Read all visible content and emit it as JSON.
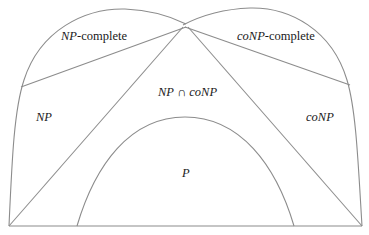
{
  "diagram": {
    "stroke_color": "#8c8c8c",
    "text_color": "#1a1a1a",
    "regions": {
      "np_complete": {
        "italic": "NP",
        "rest": "-complete"
      },
      "conp_complete": {
        "italic": "coNP",
        "rest": "-complete"
      },
      "np": {
        "italic": "NP"
      },
      "conp": {
        "italic": "coNP"
      },
      "intersection": {
        "left": "NP",
        "op": " ∩ ",
        "right": "coNP"
      },
      "p": {
        "italic": "P"
      }
    }
  }
}
